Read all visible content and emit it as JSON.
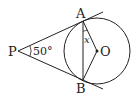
{
  "diagram": {
    "points": {
      "P": "P",
      "A": "A",
      "B": "B",
      "O": "O"
    },
    "angle_P": "50°",
    "unknown_angle": "x",
    "colors": {
      "stroke": "#222222",
      "background": "#ffffff"
    }
  }
}
